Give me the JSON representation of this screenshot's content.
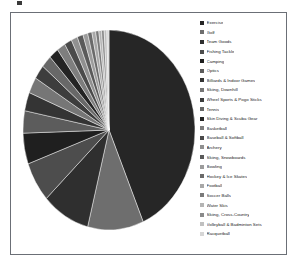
{
  "chart_data": {
    "type": "pie",
    "title": "",
    "legend_position": "right",
    "start_angle_deg": 0,
    "direction": "clockwise",
    "categories": [
      "Exercise",
      "Golf",
      "Team Goods",
      "Fishing Tackle",
      "Camping",
      "Optics",
      "Billiards & Indoor Games",
      "Skiing, Downhill",
      "Wheel Sports & Pogo Sticks",
      "Tennis",
      "Skin Diving & Scuba Gear",
      "Basketball",
      "Baseball & Softball",
      "Archery",
      "Skiing, Snowboards",
      "Bowling",
      "Hockey & Ice Skates",
      "Football",
      "Soccer Balls",
      "Water Skis",
      "Skiing, Cross-Country",
      "Volleyball & Badminton Sets",
      "Racquetball"
    ],
    "values": [
      43.5,
      10.5,
      9.0,
      6.5,
      5.0,
      3.6,
      3.0,
      2.6,
      2.3,
      2.0,
      1.8,
      1.6,
      1.4,
      1.2,
      1.1,
      0.9,
      0.8,
      0.7,
      0.6,
      0.5,
      0.5,
      0.5,
      0.4
    ],
    "unit": "percent",
    "colors": [
      "#262626",
      "#6e6e6e",
      "#2f2f2f",
      "#4d4d4d",
      "#1f1f1f",
      "#5c5c5c",
      "#343434",
      "#767676",
      "#3d3d3d",
      "#686868",
      "#242424",
      "#7e7e7e",
      "#4a4a4a",
      "#909090",
      "#5a5a5a",
      "#9c9c9c",
      "#6a6a6a",
      "#a8a8a8",
      "#7a7a7a",
      "#b4b4b4",
      "#8a8a8a",
      "#c0c0c0",
      "#d6d6d6"
    ],
    "grid": false,
    "xlabel": "",
    "ylabel": ""
  },
  "legend": {
    "items": [
      {
        "label": "Exercise",
        "color": "#262626"
      },
      {
        "label": "Golf",
        "color": "#6e6e6e"
      },
      {
        "label": "Team Goods",
        "color": "#2f2f2f"
      },
      {
        "label": "Fishing Tackle",
        "color": "#4d4d4d"
      },
      {
        "label": "Camping",
        "color": "#1f1f1f"
      },
      {
        "label": "Optics",
        "color": "#5c5c5c"
      },
      {
        "label": "Billiards & Indoor Games",
        "color": "#343434"
      },
      {
        "label": "Skiing, Downhill",
        "color": "#767676"
      },
      {
        "label": "Wheel Sports & Pogo Sticks",
        "color": "#3d3d3d"
      },
      {
        "label": "Tennis",
        "color": "#686868"
      },
      {
        "label": "Skin Diving & Scuba Gear",
        "color": "#242424"
      },
      {
        "label": "Basketball",
        "color": "#7e7e7e"
      },
      {
        "label": "Baseball & Softball",
        "color": "#4a4a4a"
      },
      {
        "label": "Archery",
        "color": "#909090"
      },
      {
        "label": "Skiing, Snowboards",
        "color": "#5a5a5a"
      },
      {
        "label": "Bowling",
        "color": "#9c9c9c"
      },
      {
        "label": "Hockey & Ice Skates",
        "color": "#6a6a6a"
      },
      {
        "label": "Football",
        "color": "#a8a8a8"
      },
      {
        "label": "Soccer Balls",
        "color": "#7a7a7a"
      },
      {
        "label": "Water Skis",
        "color": "#b4b4b4"
      },
      {
        "label": "Skiing, Cross-Country",
        "color": "#8a8a8a"
      },
      {
        "label": "Volleyball & Badminton Sets",
        "color": "#c0c0c0"
      },
      {
        "label": "Racquetball",
        "color": "#d6d6d6"
      }
    ]
  }
}
